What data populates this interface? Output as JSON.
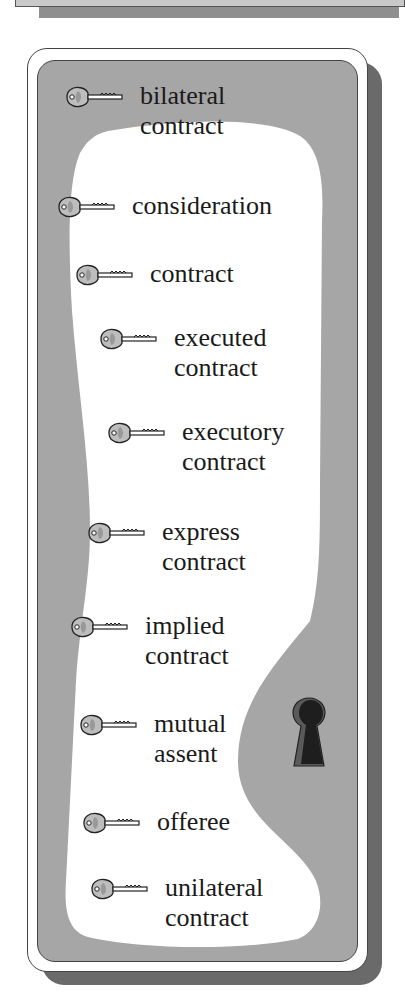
{
  "glossary": {
    "icon": "key-icon",
    "decoration_icon": "keyhole-icon",
    "colors": {
      "panel_grey": "#a6a6a6",
      "card_white": "#ffffff",
      "shadow": "#6a6a6a",
      "text": "#1a1a1a"
    },
    "terms": [
      {
        "line1": "bilateral",
        "line2": "contract"
      },
      {
        "line1": "consideration",
        "line2": ""
      },
      {
        "line1": "contract",
        "line2": ""
      },
      {
        "line1": "executed",
        "line2": "contract"
      },
      {
        "line1": "executory",
        "line2": "contract"
      },
      {
        "line1": "express",
        "line2": "contract"
      },
      {
        "line1": "implied",
        "line2": "contract"
      },
      {
        "line1": "mutual",
        "line2": "assent"
      },
      {
        "line1": "offeree",
        "line2": ""
      },
      {
        "line1": "unilateral",
        "line2": "contract"
      }
    ]
  }
}
